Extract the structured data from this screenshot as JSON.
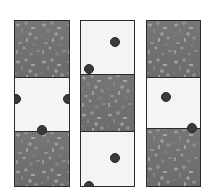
{
  "figure": {
    "background_color": "#ffffff",
    "width": 214,
    "height": 194,
    "palette": {
      "texture_fill": "#6f6f6f",
      "texture_speckle": "#9a9a9a",
      "white_fill": "#f4f4f2",
      "outline": "#2b2b2b",
      "dot_fill": "#3a3a3a"
    },
    "columns": [
      {
        "id": "column-1",
        "x": 14,
        "y": 20,
        "width": 56,
        "height": 167,
        "bands": [
          {
            "id": "c1-band-top",
            "type": "gravel",
            "top": 0,
            "height": 56,
            "label": "textured"
          },
          {
            "id": "c1-band-middle",
            "type": "white",
            "top": 56,
            "height": 54,
            "label": "plain"
          },
          {
            "id": "c1-band-bottom",
            "type": "gravel",
            "top": 110,
            "height": 57,
            "label": "textured"
          }
        ],
        "dots": [
          {
            "id": "c1-dot-left",
            "cx": 1,
            "cy": 78,
            "r": 5
          },
          {
            "id": "c1-dot-right",
            "cx": 53,
            "cy": 78,
            "r": 5
          },
          {
            "id": "c1-dot-bottom",
            "cx": 27,
            "cy": 109,
            "r": 5
          }
        ]
      },
      {
        "id": "column-2",
        "x": 80,
        "y": 20,
        "width": 55,
        "height": 167,
        "bands": [
          {
            "id": "c2-band-top",
            "type": "white",
            "top": 0,
            "height": 53,
            "label": "plain"
          },
          {
            "id": "c2-band-middle",
            "type": "gravel",
            "top": 53,
            "height": 57,
            "label": "textured"
          },
          {
            "id": "c2-band-bottom",
            "type": "white",
            "top": 110,
            "height": 57,
            "label": "plain"
          }
        ],
        "dots": [
          {
            "id": "c2-dot-upper-right",
            "cx": 34,
            "cy": 21,
            "r": 5
          },
          {
            "id": "c2-dot-mid-left",
            "cx": 8,
            "cy": 48,
            "r": 5
          },
          {
            "id": "c2-dot-lower-center",
            "cx": 34,
            "cy": 137,
            "r": 5
          },
          {
            "id": "c2-dot-bottom-left",
            "cx": 8,
            "cy": 165,
            "r": 5
          }
        ]
      },
      {
        "id": "column-3",
        "x": 146,
        "y": 20,
        "width": 55,
        "height": 167,
        "bands": [
          {
            "id": "c3-band-top",
            "type": "gravel",
            "top": 0,
            "height": 56,
            "label": "textured"
          },
          {
            "id": "c3-band-middle",
            "type": "white",
            "top": 56,
            "height": 51,
            "label": "plain"
          },
          {
            "id": "c3-band-bottom",
            "type": "gravel",
            "top": 107,
            "height": 60,
            "label": "textured"
          }
        ],
        "dots": [
          {
            "id": "c3-dot-upper-left",
            "cx": 19,
            "cy": 76,
            "r": 5
          },
          {
            "id": "c3-dot-lower-right",
            "cx": 45,
            "cy": 107,
            "r": 5
          }
        ]
      }
    ]
  }
}
